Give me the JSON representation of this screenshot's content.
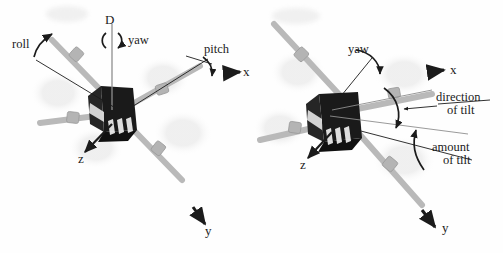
{
  "figure": {
    "title": "",
    "background_color": "#fefefe",
    "ink_color": "#1b1b1b",
    "body_color": "#171717",
    "rod_color": "#b9b9b9",
    "rotor_blur_color": "#ededed",
    "width": 503,
    "height": 253
  },
  "panels": [
    {
      "id": "left",
      "name": "roll-pitch-yaw-view",
      "labels": [
        {
          "key": "roll",
          "text": "roll",
          "kind": "rotation"
        },
        {
          "key": "D",
          "text": "D",
          "kind": "axis"
        },
        {
          "key": "yaw",
          "text": "yaw",
          "kind": "rotation"
        },
        {
          "key": "pitch",
          "text": "pitch",
          "kind": "rotation"
        },
        {
          "key": "x",
          "text": "x",
          "kind": "axis"
        },
        {
          "key": "z",
          "text": "z",
          "kind": "axis"
        },
        {
          "key": "y",
          "text": "y",
          "kind": "axis"
        }
      ]
    },
    {
      "id": "right",
      "name": "tilt-view",
      "labels": [
        {
          "key": "yaw",
          "text": "yaw",
          "kind": "rotation"
        },
        {
          "key": "x",
          "text": "x",
          "kind": "axis"
        },
        {
          "key": "direction_line1",
          "text": "direction",
          "kind": "annotation"
        },
        {
          "key": "direction_line2",
          "text": "of tilt",
          "kind": "annotation"
        },
        {
          "key": "amount_line1",
          "text": "amount",
          "kind": "annotation"
        },
        {
          "key": "amount_line2",
          "text": "of tilt",
          "kind": "annotation"
        },
        {
          "key": "z",
          "text": "z",
          "kind": "axis"
        },
        {
          "key": "y",
          "text": "y",
          "kind": "axis"
        }
      ]
    }
  ],
  "left": {
    "roll": "roll",
    "d_axis": "D",
    "yaw": "yaw",
    "pitch": "pitch",
    "x_axis": "x",
    "z_axis": "z",
    "y_axis": "y"
  },
  "right": {
    "yaw": "yaw",
    "x_axis": "x",
    "direction_of_tilt_line1": "direction",
    "direction_of_tilt_line2": "of tilt",
    "amount_of_tilt_line1": "amount",
    "amount_of_tilt_line2": "of tilt",
    "z_axis": "z",
    "y_axis": "y"
  }
}
